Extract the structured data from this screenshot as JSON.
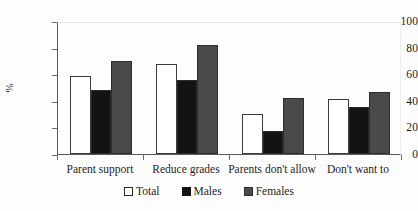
{
  "chart_data": {
    "type": "bar",
    "title": "",
    "xlabel": "",
    "ylabel": "%",
    "ylim": [
      0,
      100
    ],
    "yticks": [
      0,
      20,
      40,
      60,
      80,
      100
    ],
    "grid": false,
    "legend_position": "bottom",
    "categories": [
      "Parent support",
      "Reduce grades",
      "Parents don't allow",
      "Don't want to"
    ],
    "series": [
      {
        "name": "Total",
        "color": "#ffffff",
        "values": [
          59,
          68,
          30,
          41
        ]
      },
      {
        "name": "Males",
        "color": "#131313",
        "values": [
          48,
          56,
          17,
          35
        ]
      },
      {
        "name": "Females",
        "color": "#4a4a4a",
        "values": [
          70,
          82,
          42,
          47
        ]
      }
    ]
  },
  "axis": {
    "y_title": "%",
    "y_tick_labels": [
      "100",
      "80",
      "60",
      "40",
      "20",
      "0"
    ]
  },
  "legend": {
    "items": [
      {
        "label": "Total"
      },
      {
        "label": "Males"
      },
      {
        "label": "Females"
      }
    ]
  }
}
